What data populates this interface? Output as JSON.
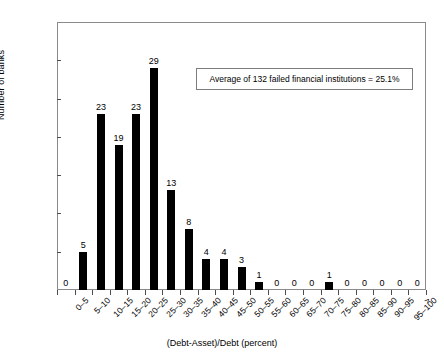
{
  "chart_data": {
    "type": "bar",
    "title": "",
    "xlabel": "(Debt-Asset)/Debt (percent)",
    "ylabel": "Number of banks",
    "ylim": [
      0,
      35
    ],
    "ytick_values": [
      0,
      5,
      10,
      15,
      20,
      25,
      30,
      35
    ],
    "ytick_labels": [
      "0",
      "5",
      "10",
      "15",
      "20",
      "25",
      "30",
      "35"
    ],
    "grid": false,
    "legend": null,
    "bar_color": "#000000",
    "categories": [
      "0–5",
      "5–10",
      "10–15",
      "15–20",
      "20–25",
      "25–30",
      "30–35",
      "35–40",
      "40–45",
      "45–50",
      "50–55",
      "55–60",
      "60–65",
      "65–70",
      "70–75",
      "75–80",
      "80–85",
      "85–90",
      "90–95",
      "95–100",
      ">"
    ],
    "values": [
      0,
      5,
      23,
      19,
      23,
      29,
      13,
      8,
      4,
      4,
      3,
      1,
      0,
      0,
      0,
      1,
      0,
      0,
      0,
      0,
      0
    ],
    "value_labels": [
      "0",
      "5",
      "23",
      "19",
      "23",
      "29",
      "13",
      "8",
      "4",
      "4",
      "3",
      "1",
      "0",
      "0",
      "0",
      "1",
      "0",
      "0",
      "0",
      "0",
      "0"
    ],
    "annotations": [
      {
        "name": "average-note",
        "text": "Average of 132 failed financial institutions = 25.1%"
      }
    ]
  }
}
